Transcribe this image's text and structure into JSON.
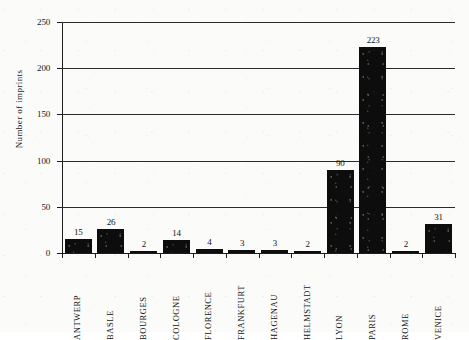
{
  "chart_data": {
    "type": "bar",
    "title": "",
    "xlabel": "",
    "ylabel": "Number of imprints",
    "ylim": [
      0,
      250
    ],
    "yticks": [
      0,
      50,
      100,
      150,
      200,
      250
    ],
    "grid": true,
    "legend": false,
    "value_labels": true,
    "categories": [
      "ANTWERP",
      "BASLE",
      "BOURGES",
      "COLOGNE",
      "FLORENCE",
      "FRANKFURT",
      "HAGENAU",
      "HELMSTADT",
      "LYON",
      "PARIS",
      "ROME",
      "VENICE"
    ],
    "values": [
      15,
      26,
      2,
      14,
      4,
      3,
      3,
      2,
      90,
      223,
      2,
      31
    ],
    "value_label_text": [
      "15",
      "26",
      "2",
      "14",
      "4",
      "3",
      "3",
      "2",
      "90",
      "223",
      "2",
      "31"
    ],
    "ytick_labels": [
      "0",
      "50",
      "100",
      "150",
      "200",
      "250"
    ],
    "colors": {
      "bar": "#0d0d0d",
      "axis": "#1c1c1c",
      "grid": "#2b2b2b",
      "text": "#141414",
      "background": "#fbfbf9"
    }
  }
}
